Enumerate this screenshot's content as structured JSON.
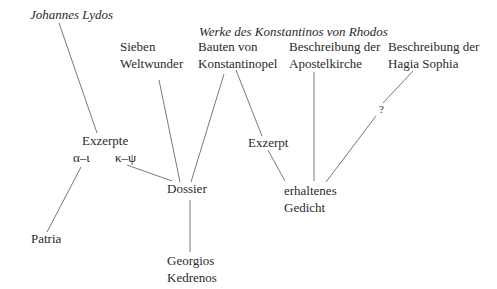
{
  "diagram": {
    "type": "stemma",
    "nodes": {
      "johannes_lydos": "Johannes Lydos",
      "werke_header": "Werke des Konstantinos von Rhodos",
      "sieben_1": "Sieben",
      "sieben_2": "Weltwunder",
      "bauten_1": "Bauten von",
      "bauten_2": "Konstantinopel",
      "apostel_1": "Beschreibung der",
      "apostel_2": "Apostelkirche",
      "hagia_1": "Beschreibung der",
      "hagia_2": "Hagia Sophia",
      "question": "?",
      "exzerpte": "Exzerpte",
      "alpha_iota": "α–ι",
      "kappa_psi": "κ–ψ",
      "exzerpt": "Exzerpt",
      "dossier": "Dossier",
      "gedicht_1": "erhaltenes",
      "gedicht_2": "Gedicht",
      "patria": "Patria",
      "georgios_1": "Georgios",
      "georgios_2": "Kedrenos"
    },
    "edges": [
      [
        "Johannes Lydos",
        "Exzerpte"
      ],
      [
        "Exzerpte α–ι",
        "Patria"
      ],
      [
        "Exzerpte κ–ψ",
        "Dossier"
      ],
      [
        "Sieben Weltwunder",
        "Dossier"
      ],
      [
        "Bauten von Konstantinopel",
        "Dossier"
      ],
      [
        "Bauten von Konstantinopel",
        "Exzerpt"
      ],
      [
        "Exzerpt",
        "erhaltenes Gedicht"
      ],
      [
        "Beschreibung der Apostelkirche",
        "erhaltenes Gedicht"
      ],
      [
        "Beschreibung der Hagia Sophia",
        "? erhaltenes Gedicht"
      ],
      [
        "Dossier",
        "Georgios Kedrenos"
      ]
    ]
  }
}
